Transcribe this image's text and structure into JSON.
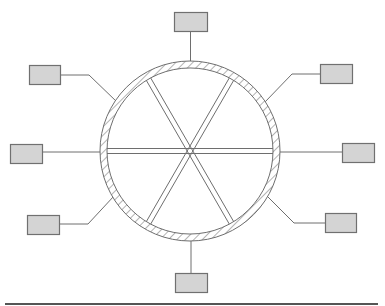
{
  "diagram": {
    "title": "",
    "colors": {
      "background": "#ffffff",
      "stroke": "#6e6e6e",
      "box_fill": "#d4d4d4",
      "box_stroke": "#707070",
      "hatch": "#8a8a8a",
      "baseline": "#555555"
    },
    "wheel": {
      "cx": 190,
      "cy": 151,
      "outer_radius": 90,
      "inner_radius": 83,
      "spokes_angles_deg": [
        0,
        60,
        120
      ]
    },
    "boxes": [
      {
        "id": "top",
        "x": 174,
        "y": 12,
        "w": 33,
        "h": 19,
        "connector": [
          [
            190.5,
            31
          ],
          [
            190.5,
            61
          ]
        ]
      },
      {
        "id": "upper-left",
        "x": 29,
        "y": 65,
        "w": 31,
        "h": 19,
        "connector": [
          [
            60,
            75
          ],
          [
            89,
            75
          ],
          [
            117,
            102
          ]
        ]
      },
      {
        "id": "upper-right",
        "x": 320,
        "y": 64,
        "w": 32,
        "h": 19,
        "connector": [
          [
            320,
            74
          ],
          [
            292,
            74
          ],
          [
            265,
            102
          ]
        ]
      },
      {
        "id": "left",
        "x": 10,
        "y": 144,
        "w": 32,
        "h": 19,
        "connector": [
          [
            42,
            152
          ],
          [
            101,
            152
          ]
        ]
      },
      {
        "id": "right",
        "x": 342,
        "y": 143,
        "w": 32,
        "h": 19,
        "connector": [
          [
            342,
            152
          ],
          [
            280,
            152
          ]
        ]
      },
      {
        "id": "lower-left",
        "x": 27,
        "y": 215,
        "w": 32,
        "h": 19,
        "connector": [
          [
            59,
            224
          ],
          [
            88,
            224
          ],
          [
            114,
            196
          ]
        ]
      },
      {
        "id": "lower-right",
        "x": 325,
        "y": 213,
        "w": 31,
        "h": 19,
        "connector": [
          [
            325,
            223
          ],
          [
            294,
            223
          ],
          [
            268,
            197
          ]
        ]
      },
      {
        "id": "bottom",
        "x": 175,
        "y": 273,
        "w": 32,
        "h": 19,
        "connector": [
          [
            191,
            273
          ],
          [
            191,
            241
          ]
        ]
      }
    ],
    "baseline": {
      "x1": 5,
      "x2": 378,
      "y": 304
    }
  }
}
